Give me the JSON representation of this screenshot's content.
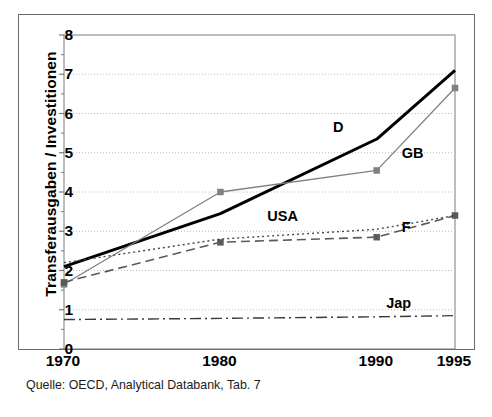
{
  "chart_data": {
    "type": "line",
    "title": "",
    "xlabel": "",
    "ylabel": "Transferausgaben / Investitionen",
    "x": [
      1970,
      1980,
      1990,
      1995
    ],
    "xtick_labels": [
      "1970",
      "1980",
      "1990",
      "1995"
    ],
    "ytick_labels": [
      "0",
      "1",
      "2",
      "3",
      "4",
      "5",
      "6",
      "7",
      "8"
    ],
    "ylim": [
      0,
      8
    ],
    "xlim": [
      1970,
      1995
    ],
    "grid": "horizontal-dotted",
    "legend": "inline-labels",
    "series": [
      {
        "name": "D",
        "label": "D",
        "values": [
          2.1,
          3.45,
          5.35,
          7.1
        ],
        "style": "solid-thick",
        "color": "#000000",
        "markers": false
      },
      {
        "name": "GB",
        "label": "GB",
        "values": [
          1.65,
          4.0,
          4.55,
          6.65
        ],
        "style": "solid-thin",
        "color": "#808080",
        "markers": true
      },
      {
        "name": "USA",
        "label": "USA",
        "values": [
          1.7,
          2.72,
          2.85,
          3.4
        ],
        "style": "dashed",
        "color": "#5a5a5a",
        "markers": true
      },
      {
        "name": "F",
        "label": "F",
        "values": [
          2.2,
          2.8,
          3.05,
          3.4
        ],
        "style": "dotted",
        "color": "#4a4a4a",
        "markers": false
      },
      {
        "name": "Jap",
        "label": "Jap",
        "values": [
          0.75,
          0.78,
          0.82,
          0.85
        ],
        "style": "dash-dot",
        "color": "#3a3a3a",
        "markers": false
      }
    ],
    "annotations": [
      {
        "text": "D",
        "x": 1987.2,
        "y": 5.6
      },
      {
        "text": "GB",
        "x": 1991.6,
        "y": 4.95
      },
      {
        "text": "USA",
        "x": 1983.0,
        "y": 3.35
      },
      {
        "text": "F",
        "x": 1991.6,
        "y": 3.05
      },
      {
        "text": "Jap",
        "x": 1990.6,
        "y": 1.12
      }
    ]
  },
  "source": {
    "text": "Quelle: OECD, Analytical Databank, Tab. 7"
  },
  "colors": {
    "frame": "#6b6b6b",
    "axis": "#7a7a7a",
    "grid": "#bdbdbd",
    "text": "#000000"
  }
}
